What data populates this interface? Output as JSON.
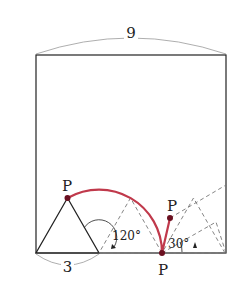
{
  "diagram": {
    "type": "geometry",
    "labels": {
      "top_width": "9",
      "triangle_side": "3",
      "angle_rotation": "120°",
      "angle_small": "30°",
      "point_start": "P",
      "point_bottom": "P",
      "point_end": "P"
    },
    "colors": {
      "outline": "#222222",
      "dashed": "#777777",
      "trace_path": "#c0394b",
      "dimension_arc": "#999999"
    }
  }
}
